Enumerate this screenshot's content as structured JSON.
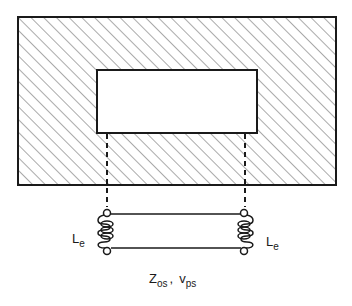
{
  "diagram": {
    "colors": {
      "stroke": "#1a1a1a",
      "hatch": "#555555",
      "background": "#ffffff",
      "aperture_fill": "#ffffff"
    },
    "outer_block": {
      "label": "",
      "fill": "diagonal-hatch"
    },
    "aperture": {
      "label": ""
    },
    "left_inductor": {
      "label_main": "L",
      "label_sub": "e"
    },
    "right_inductor": {
      "label_main": "L",
      "label_sub": "e"
    },
    "line_params": {
      "z_main": "Z",
      "z_sub": "os",
      "separator": ",",
      "v_main": "v",
      "v_sub": "ps"
    }
  }
}
